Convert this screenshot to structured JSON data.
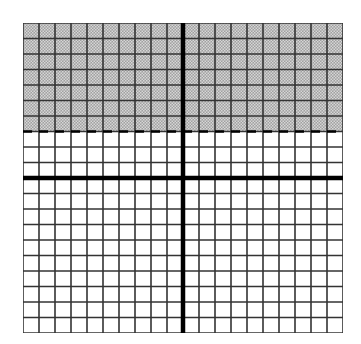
{
  "graph": {
    "description": "Coordinate grid with shaded half-plane above dashed line y = 3",
    "columns": 20,
    "rows": 20,
    "x_range": [
      -10,
      10
    ],
    "y_range": [
      -10,
      10
    ],
    "boundary": {
      "type": "dashed",
      "equation": "y = 3",
      "y_value": 3
    },
    "shaded_region": "y > 3",
    "colors": {
      "grid_line": "#333333",
      "axis": "#000000",
      "shade": "#9a9a9a",
      "shade_dot": "#d8d8d8",
      "background": "#ffffff"
    }
  }
}
